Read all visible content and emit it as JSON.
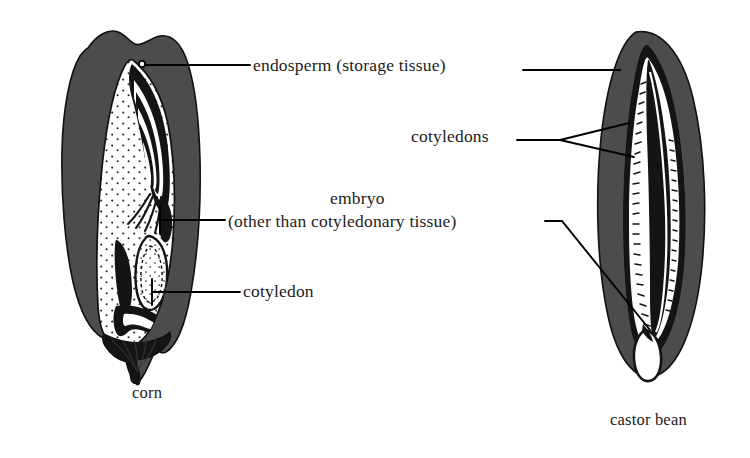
{
  "figure": {
    "type": "botanical-diagram",
    "background_color": "#ffffff"
  },
  "colors": {
    "seed_coat_gray": "#4c4c4c",
    "tissue_black": "#141414",
    "tissue_white": "#ffffff",
    "leader_line": "#000000",
    "text": "#1c1c1c"
  },
  "annotations": [
    {
      "id": "endosperm",
      "text": "endosperm (storage tissue)",
      "points_to": [
        "corn",
        "castor bean"
      ]
    },
    {
      "id": "cotyledons",
      "text": "cotyledons",
      "points_to": [
        "castor bean"
      ]
    },
    {
      "id": "embryo-line-1",
      "text": "embryo",
      "points_to": []
    },
    {
      "id": "embryo-line-2",
      "text": "(other than cotyledonary tissue)",
      "points_to": [
        "corn",
        "castor bean"
      ]
    },
    {
      "id": "cotyledon",
      "text": "cotyledon",
      "points_to": [
        "corn"
      ]
    }
  ],
  "specimens": [
    {
      "id": "corn",
      "caption": "corn",
      "position": "left"
    },
    {
      "id": "castor-bean",
      "caption": "castor bean",
      "position": "right"
    }
  ],
  "captions": {
    "left": "corn",
    "right": "castor bean"
  }
}
